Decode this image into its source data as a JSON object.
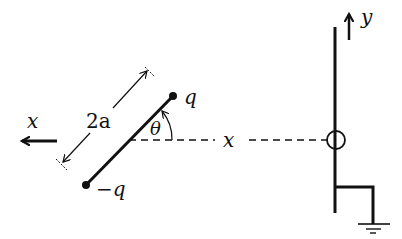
{
  "diagram": {
    "type": "physics",
    "labels": {
      "x_axis": "x",
      "y_axis": "y",
      "length": "2a",
      "angle": "θ",
      "distance": "x",
      "positive_charge": "q",
      "negative_charge": "−q"
    },
    "colors": {
      "ink": "#111111",
      "background": "#ffffff"
    }
  }
}
